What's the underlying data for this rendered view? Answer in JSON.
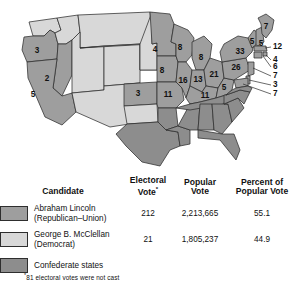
{
  "figure": {
    "kind": "election-map-with-legend-table",
    "colors": {
      "union_lincoln": "#9e9e9e",
      "union_mcclellan": "#d8d8d8",
      "confederate": "#8d8d8d",
      "border": "#2e2e2e",
      "text": "#111111"
    }
  },
  "map": {
    "state_labels": [
      {
        "name": "oregon",
        "value": "3",
        "x": 37,
        "y": 51
      },
      {
        "name": "nevada",
        "value": "2",
        "x": 47,
        "y": 79
      },
      {
        "name": "california",
        "value": "5",
        "x": 33,
        "y": 95
      },
      {
        "name": "kansas",
        "value": "3",
        "x": 138,
        "y": 94
      },
      {
        "name": "minnesota",
        "value": "4",
        "x": 155,
        "y": 50
      },
      {
        "name": "iowa",
        "value": "8",
        "x": 162,
        "y": 71
      },
      {
        "name": "wisconsin",
        "value": "8",
        "x": 176,
        "y": 48
      },
      {
        "name": "michigan",
        "value": "8",
        "x": 199,
        "y": 60
      },
      {
        "name": "missouri",
        "value": "11",
        "x": 168,
        "y": 93
      },
      {
        "name": "illinois",
        "value": "16",
        "x": 181,
        "y": 80
      },
      {
        "name": "indiana",
        "value": "13",
        "x": 197,
        "y": 79
      },
      {
        "name": "ohio",
        "value": "21",
        "x": 213,
        "y": 75
      },
      {
        "name": "kentucky",
        "value": "11",
        "x": 205,
        "y": 94
      },
      {
        "name": "west-virginia",
        "value": "5",
        "x": 224,
        "y": 86
      },
      {
        "name": "pennsylvania",
        "value": "26",
        "x": 237,
        "y": 67
      },
      {
        "name": "new-york",
        "value": "33",
        "x": 244,
        "y": 52
      },
      {
        "name": "maine",
        "value": "7",
        "x": 265,
        "y": 30
      },
      {
        "name": "vermont",
        "value": "5",
        "x": 252,
        "y": 42
      },
      {
        "name": "new-hampshire",
        "value": "5",
        "x": 261,
        "y": 44
      }
    ],
    "callouts": [
      {
        "name": "massachusetts",
        "value": "12",
        "x": 273,
        "y": 47
      },
      {
        "name": "rhode-island",
        "value": "4",
        "x": 273,
        "y": 60
      },
      {
        "name": "connecticut",
        "value": "6",
        "x": 273,
        "y": 67
      },
      {
        "name": "new-jersey",
        "value": "7",
        "x": 273,
        "y": 76
      },
      {
        "name": "delaware",
        "value": "3",
        "x": 273,
        "y": 85
      },
      {
        "name": "maryland",
        "value": "7",
        "x": 273,
        "y": 94
      }
    ]
  },
  "table": {
    "headers": {
      "candidate": "Candidate",
      "electoral_vote_line1": "Electoral",
      "electoral_vote_line2": "Vote",
      "electoral_vote_star": "*",
      "popular_vote_line1": "Popular",
      "popular_vote_line2": "Vote",
      "percent_line1": "Percent of",
      "percent_line2": "Popular Vote"
    },
    "rows": [
      {
        "name": "Abraham Lincoln",
        "party": "(Republican–Union)",
        "electoral_vote": "212",
        "popular_vote": "2,213,665",
        "percent": "55.1",
        "swatch": "sw-lincoln"
      },
      {
        "name": "George B. McClellan",
        "party": "(Democrat)",
        "electoral_vote": "21",
        "popular_vote": "1,805,237",
        "percent": "44.9",
        "swatch": "sw-mcclellan"
      }
    ],
    "confederate_label": "Confederate states",
    "footnote": "81 electoral votes were not cast",
    "footnote_star": "*"
  }
}
